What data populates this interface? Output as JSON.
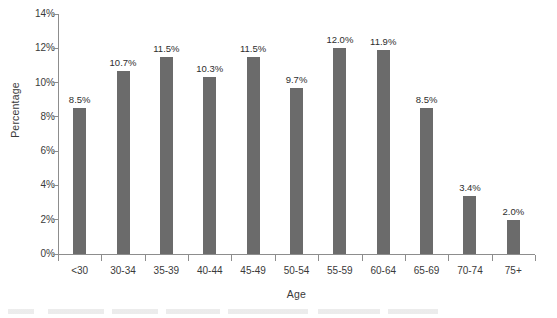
{
  "chart_data": {
    "type": "bar",
    "title": "",
    "subtitle": "",
    "xlabel": "Age",
    "ylabel": "Percentage",
    "categories": [
      "<30",
      "30-34",
      "35-39",
      "40-44",
      "45-49",
      "50-54",
      "55-59",
      "60-64",
      "65-69",
      "70-74",
      "75+"
    ],
    "values": [
      8.5,
      10.7,
      11.5,
      10.3,
      11.5,
      9.7,
      12.0,
      11.9,
      8.5,
      3.4,
      2.0
    ],
    "value_labels": [
      "8.5%",
      "10.7%",
      "11.5%",
      "10.3%",
      "11.5%",
      "9.7%",
      "12.0%",
      "11.9%",
      "8.5%",
      "3.4%",
      "2.0%"
    ],
    "ylim": [
      0,
      14
    ],
    "ytick_values": [
      0,
      2,
      4,
      6,
      8,
      10,
      12,
      14
    ],
    "ytick_labels": [
      "0%",
      "2%",
      "4%",
      "6%",
      "8%",
      "10%",
      "12%",
      "14%"
    ],
    "grid": false,
    "legend": null,
    "bar_color": "#6b6b6b",
    "axis_color": "#8d8d8d",
    "text_color": "#3a3a3a",
    "background": "#ffffff"
  }
}
